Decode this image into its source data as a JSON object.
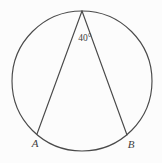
{
  "figure": {
    "background_color": "#fcfcfc",
    "stroke_color": "#4a4a4a",
    "text_color": "#3f3f3f",
    "circle": {
      "center_x": 82,
      "center_y": 81,
      "radius": 70
    },
    "vertex": {
      "name": "apex-vertex",
      "x": 82,
      "y": 11
    },
    "points": [
      {
        "id": "A",
        "label": "A",
        "x": 37,
        "y": 134,
        "label_x": 35,
        "label_y": 144
      },
      {
        "id": "B",
        "label": "B",
        "x": 127,
        "y": 135,
        "label_x": 131,
        "label_y": 145
      }
    ],
    "angle": {
      "label": "40°",
      "value": 40,
      "unit": "degrees",
      "label_x": 85,
      "label_y": 39
    },
    "chords": [
      {
        "id": "chord-vertex-a",
        "x1": 82,
        "y1": 11,
        "x2": 37,
        "y2": 134
      },
      {
        "id": "chord-vertex-b",
        "x1": 82,
        "y1": 11,
        "x2": 127,
        "y2": 135
      }
    ]
  }
}
